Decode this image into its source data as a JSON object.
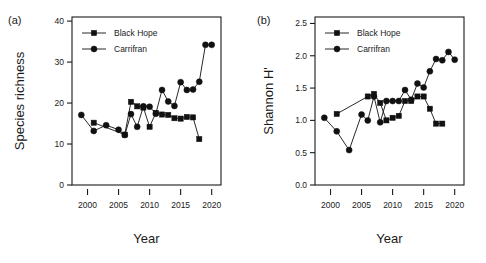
{
  "figure": {
    "panel_a_label": "(a)",
    "panel_b_label": "(b)",
    "caption": ""
  },
  "chart_data": [
    {
      "id": "panel-a",
      "type": "line",
      "title": "",
      "panel_label": "(a)",
      "xlabel": "Year",
      "ylabel": "Species richness",
      "xlim": [
        1997.5,
        2021.5
      ],
      "ylim": [
        0,
        41
      ],
      "xticks": [
        2000,
        2005,
        2010,
        2015,
        2020
      ],
      "yticks": [
        0,
        10,
        20,
        30,
        40
      ],
      "xticklabels": [
        "2000",
        "2005",
        "2010",
        "2015",
        "2020"
      ],
      "yticklabels": [
        "0",
        "10",
        "20",
        "30",
        "40"
      ],
      "grid": false,
      "legend_position": "top-left",
      "series": [
        {
          "name": "Black Hope",
          "marker": "square",
          "x": [
            2001,
            2006,
            2007,
            2008,
            2009,
            2010,
            2011,
            2012,
            2013,
            2014,
            2015,
            2016,
            2017,
            2018
          ],
          "y": [
            15.2,
            12.3,
            20.3,
            19.2,
            18.9,
            14.2,
            17.6,
            17.2,
            17.1,
            16.3,
            16.2,
            16.6,
            16.5,
            11.2
          ]
        },
        {
          "name": "Carrifran",
          "marker": "circle",
          "x": [
            1999,
            2001,
            2003,
            2005,
            2006,
            2007,
            2008,
            2009,
            2010,
            2011,
            2012,
            2013,
            2014,
            2015,
            2016,
            2017,
            2018,
            2019,
            2020
          ],
          "y": [
            17.1,
            13.2,
            14.6,
            13.5,
            12.2,
            17.3,
            14.2,
            19.2,
            19.1,
            17.4,
            23.2,
            20.4,
            19.3,
            25.1,
            23.2,
            23.3,
            25.2,
            34.2,
            34.2
          ]
        }
      ]
    },
    {
      "id": "panel-b",
      "type": "line",
      "title": "",
      "panel_label": "(b)",
      "xlabel": "Year",
      "ylabel": "Shannon H'",
      "xlim": [
        1997.5,
        2021.5
      ],
      "ylim": [
        0.0,
        2.6
      ],
      "xticks": [
        2000,
        2005,
        2010,
        2015,
        2020
      ],
      "yticks": [
        0.0,
        0.5,
        1.0,
        1.5,
        2.0,
        2.5
      ],
      "xticklabels": [
        "2000",
        "2005",
        "2010",
        "2015",
        "2020"
      ],
      "yticklabels": [
        "0.0",
        "0.5",
        "1.0",
        "1.5",
        "2.0",
        "2.5"
      ],
      "grid": false,
      "legend_position": "top-left",
      "series": [
        {
          "name": "Black Hope",
          "marker": "square",
          "x": [
            2001,
            2006,
            2007,
            2008,
            2009,
            2010,
            2011,
            2012,
            2013,
            2014,
            2015,
            2016,
            2017,
            2018
          ],
          "y": [
            1.1,
            1.37,
            1.41,
            1.27,
            1.0,
            1.04,
            1.07,
            1.3,
            1.3,
            1.37,
            1.37,
            1.18,
            0.95,
            0.95
          ]
        },
        {
          "name": "Carrifran",
          "marker": "circle",
          "x": [
            1999,
            2001,
            2003,
            2005,
            2006,
            2007,
            2008,
            2009,
            2010,
            2011,
            2012,
            2013,
            2014,
            2015,
            2016,
            2017,
            2018,
            2019,
            2020
          ],
          "y": [
            1.04,
            0.83,
            0.54,
            1.09,
            1.0,
            1.37,
            0.97,
            1.3,
            1.3,
            1.3,
            1.47,
            1.32,
            1.57,
            1.51,
            1.76,
            1.95,
            1.93,
            2.06,
            1.94
          ]
        }
      ]
    }
  ],
  "legend": {
    "entries": [
      {
        "label": "Black Hope",
        "marker": "square"
      },
      {
        "label": "Carrifran",
        "marker": "circle"
      }
    ]
  }
}
